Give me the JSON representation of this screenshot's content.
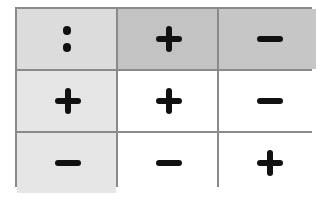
{
  "table": {
    "rows": [
      [
        {
          "symbol": "ratio",
          "text": ":",
          "bg": "#dcdcdc"
        },
        {
          "symbol": "plus",
          "text": "+",
          "bg": "#c3c3c3"
        },
        {
          "symbol": "minus",
          "text": "−",
          "bg": "#c6c6c6"
        }
      ],
      [
        {
          "symbol": "plus",
          "text": "+",
          "bg": "#e6e6e6"
        },
        {
          "symbol": "plus",
          "text": "+",
          "bg": "#ffffff"
        },
        {
          "symbol": "minus",
          "text": "−",
          "bg": "#ffffff"
        }
      ],
      [
        {
          "symbol": "minus",
          "text": "−",
          "bg": "#e6e6e6"
        },
        {
          "symbol": "minus",
          "text": "−",
          "bg": "#ffffff"
        },
        {
          "symbol": "plus",
          "text": "+",
          "bg": "#ffffff"
        }
      ]
    ],
    "border_color": "#8a8a8a",
    "symbol_color": "#111111"
  }
}
